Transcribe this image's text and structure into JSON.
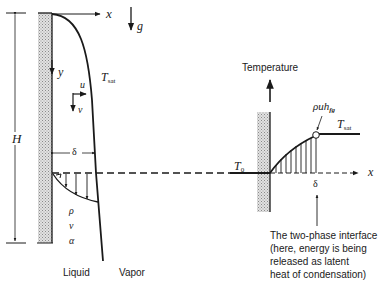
{
  "figure": {
    "left_panel": {
      "axis_x": "x",
      "axis_y": "y",
      "gravity": "g",
      "height_label": "H",
      "surface_temp_label": "T",
      "surface_temp_sub": "sat",
      "velocity_u": "u",
      "velocity_v": "v",
      "film_thickness": "δ",
      "properties": [
        "ρ",
        "ν",
        "α"
      ],
      "region_liquid": "Liquid",
      "region_vapor": "Vapor"
    },
    "right_panel": {
      "axis_title": "Temperature",
      "axis_x": "x",
      "wall_temp_label": "T",
      "wall_temp_sub": "0",
      "sat_temp_label": "T",
      "sat_temp_sub": "sat",
      "energy_flux_label": "ρuh",
      "energy_flux_sub": "fg",
      "delta_label": "δ",
      "interface_note": [
        "The two-phase interface",
        "(here, energy is being",
        "released as latent",
        "heat of condensation)"
      ]
    }
  },
  "colors": {
    "ink": "#1a1a1a",
    "hatch": "#b8b8b8",
    "background": "#ffffff"
  }
}
